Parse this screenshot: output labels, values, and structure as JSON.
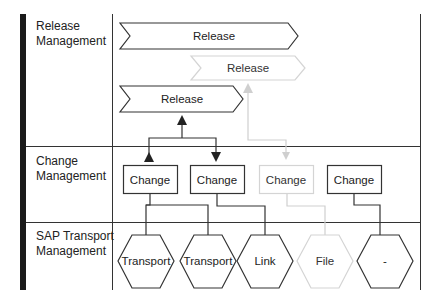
{
  "lanes": [
    {
      "id": "release",
      "label_line1": "Release",
      "label_line2": "Management"
    },
    {
      "id": "change",
      "label_line1": "Change",
      "label_line2": "Management"
    },
    {
      "id": "transport",
      "label_line1": "SAP Transport",
      "label_line2": "Management"
    }
  ],
  "releases": [
    {
      "label": "Release",
      "faded": false
    },
    {
      "label": "Release",
      "faded": true
    },
    {
      "label": "Release",
      "faded": false
    }
  ],
  "changes": [
    {
      "label": "Change",
      "faded": false
    },
    {
      "label": "Change",
      "faded": false
    },
    {
      "label": "Change",
      "faded": true
    },
    {
      "label": "Change",
      "faded": false
    }
  ],
  "objects": [
    {
      "label": "Transport",
      "faded": false
    },
    {
      "label": "Transport",
      "faded": false
    },
    {
      "label": "Link",
      "faded": false
    },
    {
      "label": "File",
      "faded": true
    },
    {
      "label": "-",
      "faded": false
    }
  ],
  "colors": {
    "stroke": "#333333",
    "faded": "#cfcfcf",
    "text": "#222222",
    "faded_text": "#333333"
  }
}
